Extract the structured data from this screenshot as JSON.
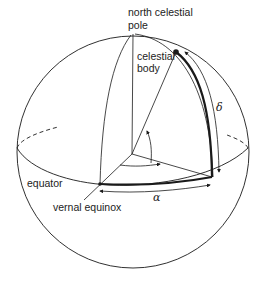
{
  "diagram": {
    "labels": {
      "north_pole_line1": "north celestial",
      "north_pole_line2": "pole",
      "body_line1": "celestial",
      "body_line2": "body",
      "equator": "equator",
      "vernal_equinox": "vernal equinox",
      "declination": "δ",
      "right_ascension": "α"
    },
    "colors": {
      "stroke": "#1a1a1a",
      "background": "#ffffff"
    },
    "elements": [
      "celestial-sphere",
      "equator-ellipse",
      "polar-axis",
      "meridian-through-vernal-equinox",
      "hour-circle-through-body",
      "line-to-body",
      "line-to-vernal-equinox",
      "right-ascension-arc",
      "declination-arc",
      "angle-arrows"
    ]
  }
}
